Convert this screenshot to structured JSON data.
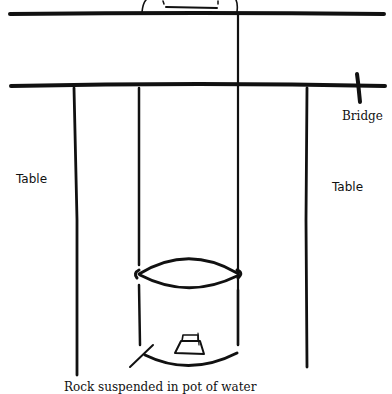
{
  "diagram": {
    "labels": {
      "bridge": "Bridge",
      "table_left": "Table",
      "table_right": "Table",
      "caption": "Rock suspended in pot of water"
    },
    "colors": {
      "ink": "#111111",
      "background": "#ffffff"
    },
    "elements": [
      "top-horizontal-rod",
      "bridge-horizontal-rod",
      "bridge-post",
      "left-table-leg",
      "right-table-leg",
      "left-string",
      "right-string",
      "pot-rim",
      "pot-body",
      "rock",
      "pointer-line",
      "top-object"
    ]
  }
}
